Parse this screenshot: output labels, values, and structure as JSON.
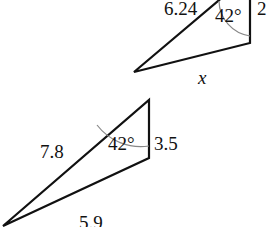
{
  "diagram": {
    "top_triangle": {
      "hypotenuse_label": "6.24",
      "angle_label": "42°",
      "vertical_side_label": "2",
      "bottom_side_label": "x"
    },
    "bottom_triangle": {
      "hypotenuse_label": "7.8",
      "angle_label": "42°",
      "vertical_side_label": "3.5",
      "bottom_side_label": "5.9"
    },
    "colors": {
      "stroke": "#111111",
      "arc": "#888888"
    }
  }
}
